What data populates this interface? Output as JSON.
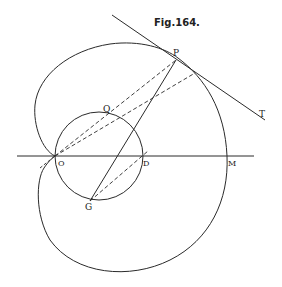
{
  "figure": {
    "title": "Fig.164.",
    "labels": {
      "P": "P",
      "T": "T",
      "Q": "Q",
      "O": "O",
      "D": "D",
      "M": "M",
      "G": "G"
    },
    "colors": {
      "ink": "#2a2a2a",
      "background": "#ffffff"
    }
  }
}
